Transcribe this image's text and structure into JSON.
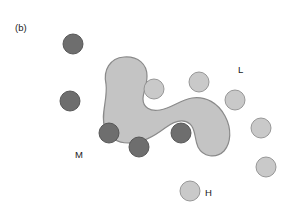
{
  "figure": {
    "panel_label": "(b)",
    "background_color": "#ffffff",
    "width": 293,
    "height": 212
  },
  "chart_data": {
    "type": "scatter",
    "title": "(b)",
    "xlabel": "",
    "ylabel": "",
    "xlim": [
      0,
      293
    ],
    "ylim": [
      0,
      212
    ],
    "grid": false,
    "legend_position": "inline-annotations",
    "legend": [
      {
        "key": "M",
        "label": "M",
        "color": "#6e6e6e",
        "description": "dark gray circles"
      },
      {
        "key": "L",
        "label": "L",
        "color": "#c9c9c9",
        "description": "light gray circles"
      },
      {
        "key": "H",
        "label": "H",
        "color": "#c9c9c9",
        "description": "light gray circle lower region"
      }
    ],
    "annotations": [
      {
        "text": "(b)",
        "x": 15,
        "y": 31
      },
      {
        "text": "M",
        "x": 75,
        "y": 158
      },
      {
        "text": "L",
        "x": 238,
        "y": 73
      },
      {
        "text": "H",
        "x": 205,
        "y": 196
      }
    ],
    "series": [
      {
        "name": "dark-circles",
        "color": "#6e6e6e",
        "stroke": "#4f4f4f",
        "radius": 10,
        "points": [
          {
            "x": 73,
            "y": 44
          },
          {
            "x": 70,
            "y": 101
          },
          {
            "x": 109,
            "y": 133
          },
          {
            "x": 139,
            "y": 147
          },
          {
            "x": 181,
            "y": 133
          }
        ]
      },
      {
        "name": "light-circles",
        "color": "#c9c9c9",
        "stroke": "#8f8f8f",
        "radius": 10,
        "points": [
          {
            "x": 154,
            "y": 89
          },
          {
            "x": 199,
            "y": 82
          },
          {
            "x": 235,
            "y": 100
          },
          {
            "x": 261,
            "y": 128
          },
          {
            "x": 266,
            "y": 167
          },
          {
            "x": 190,
            "y": 191
          }
        ]
      }
    ],
    "region": {
      "name": "shaded-blob",
      "fill": "#c4c4c4",
      "stroke": "#8a8a8a",
      "stroke_width": 1.2,
      "path": "M 106 84 C 103 70, 110 58, 124 57 C 138 56, 147 64, 147 76 C 147 86, 143 92, 143 99 C 143 107, 150 112, 160 110 C 172 108, 180 100, 192 98 C 206 96, 218 103, 225 116 C 232 129, 231 143, 224 151 C 216 159, 203 157, 198 147 C 194 138, 196 129, 190 124 C 183 118, 173 122, 165 128 C 153 137, 142 143, 128 143 C 118 143, 109 138, 105 128 C 100 116, 108 99, 106 84 Z"
    }
  }
}
